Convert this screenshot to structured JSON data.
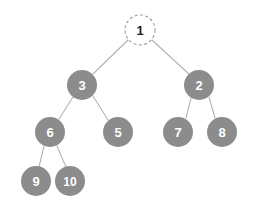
{
  "figure": {
    "width": 254,
    "height": 209,
    "background_color": "#ffffff"
  },
  "style": {
    "node_fill": "#8c8c8c",
    "node_label_color": "#ffffff",
    "root_fill": "#ffffff",
    "root_stroke": "#9a9a9a",
    "root_label_color": "#1d1d1d",
    "edge_color": "#b3b3b3",
    "node_radius": 15,
    "root_border_style": "dashed"
  },
  "chart_data": {
    "type": "diagram",
    "diagram_kind": "binary-tree",
    "title": "",
    "nodes": [
      {
        "id": "n1",
        "label": "1",
        "x": 140,
        "y": 30,
        "r": 15,
        "depth": 0,
        "fill": "#ffffff",
        "text_color": "#1d1d1d",
        "border": "dashed",
        "highlighted": true
      },
      {
        "id": "n3",
        "label": "3",
        "x": 82,
        "y": 85,
        "r": 15,
        "depth": 1,
        "fill": "#8c8c8c",
        "text_color": "#ffffff",
        "border": "none",
        "highlighted": false
      },
      {
        "id": "n2",
        "label": "2",
        "x": 199,
        "y": 85,
        "r": 15,
        "depth": 1,
        "fill": "#8c8c8c",
        "text_color": "#ffffff",
        "border": "none",
        "highlighted": false
      },
      {
        "id": "n6",
        "label": "6",
        "x": 50,
        "y": 132,
        "r": 15,
        "depth": 2,
        "fill": "#8c8c8c",
        "text_color": "#ffffff",
        "border": "none",
        "highlighted": false
      },
      {
        "id": "n5",
        "label": "5",
        "x": 118,
        "y": 132,
        "r": 15,
        "depth": 2,
        "fill": "#8c8c8c",
        "text_color": "#ffffff",
        "border": "none",
        "highlighted": false
      },
      {
        "id": "n7",
        "label": "7",
        "x": 178,
        "y": 132,
        "r": 15,
        "depth": 2,
        "fill": "#8c8c8c",
        "text_color": "#ffffff",
        "border": "none",
        "highlighted": false
      },
      {
        "id": "n8",
        "label": "8",
        "x": 222,
        "y": 132,
        "r": 15,
        "depth": 2,
        "fill": "#8c8c8c",
        "text_color": "#ffffff",
        "border": "none",
        "highlighted": false
      },
      {
        "id": "n9",
        "label": "9",
        "x": 36,
        "y": 181,
        "r": 15,
        "depth": 3,
        "fill": "#8c8c8c",
        "text_color": "#ffffff",
        "border": "none",
        "highlighted": false
      },
      {
        "id": "n10",
        "label": "10",
        "x": 70,
        "y": 181,
        "r": 15,
        "depth": 3,
        "fill": "#8c8c8c",
        "text_color": "#ffffff",
        "border": "none",
        "highlighted": false
      }
    ],
    "edges": [
      {
        "id": "e1-3",
        "from": "n1",
        "to": "n3",
        "x1": 128,
        "y1": 40,
        "x2": 93,
        "y2": 74
      },
      {
        "id": "e1-2",
        "from": "n1",
        "to": "n2",
        "x1": 152,
        "y1": 40,
        "x2": 189,
        "y2": 74
      },
      {
        "id": "e3-6",
        "from": "n3",
        "to": "n6",
        "x1": 73,
        "y1": 97,
        "x2": 59,
        "y2": 119
      },
      {
        "id": "e3-5",
        "from": "n3",
        "to": "n5",
        "x1": 93,
        "y1": 96,
        "x2": 108,
        "y2": 120
      },
      {
        "id": "e2-7",
        "from": "n2",
        "to": "n7",
        "x1": 191,
        "y1": 98,
        "x2": 186,
        "y2": 118
      },
      {
        "id": "e2-8",
        "from": "n2",
        "to": "n8",
        "x1": 209,
        "y1": 97,
        "x2": 215,
        "y2": 118
      },
      {
        "id": "e6-9",
        "from": "n6",
        "to": "n9",
        "x1": 44,
        "y1": 146,
        "x2": 39,
        "y2": 167
      },
      {
        "id": "e6-10",
        "from": "n6",
        "to": "n10",
        "x1": 57,
        "y1": 146,
        "x2": 66,
        "y2": 167
      }
    ]
  }
}
